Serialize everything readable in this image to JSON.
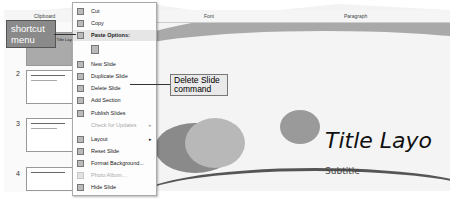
{
  "ribbon": {
    "groups": [
      {
        "label": "Clipboard"
      },
      {
        "label": "Font"
      },
      {
        "label": "Paragraph"
      }
    ]
  },
  "thumbnails": [
    {
      "number": "1",
      "title": "Title Layout"
    },
    {
      "number": "2",
      "title": "Two Content Layout"
    },
    {
      "number": "3",
      "title": "Two Content Layout"
    },
    {
      "number": "4",
      "title": "Two Content Layout"
    }
  ],
  "context_menu": {
    "items": [
      {
        "label": "Cut",
        "icon": "scissors-icon",
        "enabled": true
      },
      {
        "label": "Copy",
        "icon": "copy-icon",
        "enabled": true
      },
      {
        "label": "Paste Options:",
        "icon": "paste-icon",
        "enabled": true,
        "highlighted": true
      },
      {
        "label": "",
        "icon": "paste-keep-icon",
        "enabled": true
      },
      {
        "label": "New Slide",
        "icon": "new-slide-icon",
        "enabled": true
      },
      {
        "label": "Duplicate Slide",
        "icon": "duplicate-slide-icon",
        "enabled": true
      },
      {
        "label": "Delete Slide",
        "icon": "delete-slide-icon",
        "enabled": true
      },
      {
        "label": "Add Section",
        "icon": "add-section-icon",
        "enabled": true
      },
      {
        "label": "Publish Slides",
        "icon": "publish-icon",
        "enabled": true
      },
      {
        "label": "Check for Updates",
        "icon": "",
        "enabled": false,
        "submenu": true
      },
      {
        "label": "Layout",
        "icon": "layout-icon",
        "enabled": true,
        "submenu": true
      },
      {
        "label": "Reset Slide",
        "icon": "reset-icon",
        "enabled": true
      },
      {
        "label": "Format Background...",
        "icon": "format-background-icon",
        "enabled": true
      },
      {
        "label": "Photo Album...",
        "icon": "photo-album-icon",
        "enabled": false
      },
      {
        "label": "Hide Slide",
        "icon": "hide-slide-icon",
        "enabled": true
      }
    ]
  },
  "slide": {
    "title": "Title Layo",
    "subtitle": "Subtitle"
  },
  "callouts": {
    "shortcut_menu": "shortcut menu",
    "delete_slide_line1": "Delete Slide",
    "delete_slide_line2": "command"
  }
}
